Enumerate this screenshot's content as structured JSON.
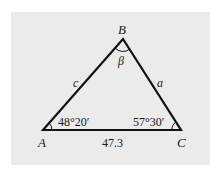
{
  "figure": {
    "background_color": "#ebebeb",
    "line_color": "#111111",
    "vertices": {
      "A": {
        "label": "A",
        "x": 43,
        "y": 130
      },
      "B": {
        "label": "B",
        "x": 123,
        "y": 39
      },
      "C": {
        "label": "C",
        "x": 181,
        "y": 130
      }
    },
    "sides": {
      "c": {
        "label": "c"
      },
      "a": {
        "label": "a"
      },
      "b": {
        "label": "47.3"
      }
    },
    "angles": {
      "A": {
        "label": "48°20′"
      },
      "B": {
        "label": "β"
      },
      "C": {
        "label": "57°30′"
      }
    }
  }
}
